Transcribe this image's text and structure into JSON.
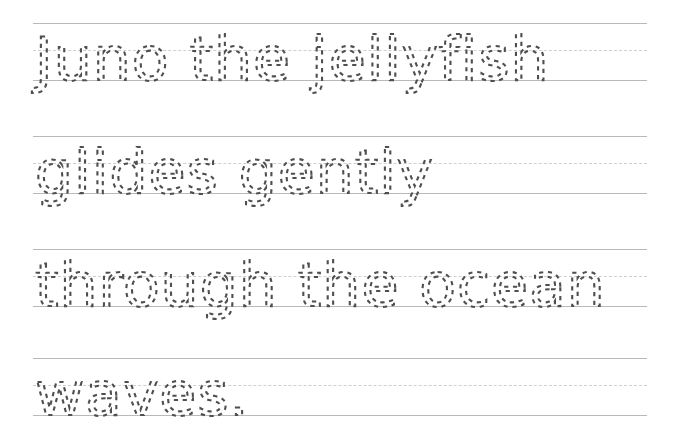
{
  "worksheet": {
    "type": "handwriting-tracing-practice",
    "background_color": "#ffffff",
    "rule_color": "#b9b9bc",
    "midline_color": "#cfcfd3",
    "trace_color": "#4f4f53",
    "sentence": "Juno the jellyfish glides gently through the ocean waves.",
    "lines": [
      {
        "text": "Juno the jellyfish"
      },
      {
        "text": "glides gently"
      },
      {
        "text": "through the ocean"
      },
      {
        "text": "waves."
      }
    ]
  }
}
